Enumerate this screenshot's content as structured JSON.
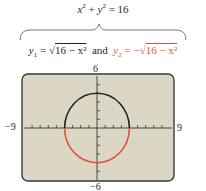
{
  "equation_top": {
    "lhs": "x² + y² = 16",
    "x": "x",
    "y": "y",
    "rest": " = 16"
  },
  "equation_split": {
    "y1_label": "y",
    "y1_sub": "1",
    "y1_expr": " = √",
    "y1_radicand": "16 − x²",
    "connector": "and",
    "y2_label": "y",
    "y2_sub": "2",
    "y2_expr": " = −√",
    "y2_radicand": "16 − x²"
  },
  "graph": {
    "xmin_label": "−9",
    "xmax_label": "9",
    "ymax_label": "6",
    "ymin_label": "−6",
    "screen_color": "#dcd7c5",
    "upper_curve_color": "#231f20",
    "lower_curve_color": "#e0533a",
    "radius": 4
  },
  "colors": {
    "accent_red": "#e0533a",
    "text": "#231f20"
  }
}
